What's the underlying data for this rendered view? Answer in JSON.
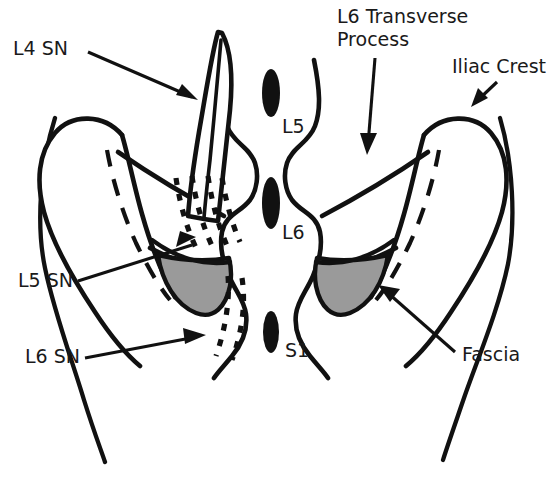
{
  "figure": {
    "background_color": "#ffffff",
    "line_color": "#111111",
    "fascia_fill_color": "#9a9a9a",
    "bone_fill_color": "#ffffff",
    "width": 555,
    "height": 479
  },
  "callouts": [
    {
      "id": "l4-sn",
      "label": "L4 SN",
      "label_x": 13,
      "label_y": 55,
      "anchor": "start",
      "pointer_type": "arrow",
      "meaning": "L4 spinal nerve"
    },
    {
      "id": "l6-transverse-process",
      "label_line_1": "L6 Transverse",
      "label_line_2": "Process",
      "label_x": 337,
      "label_y": 23,
      "anchor": "start",
      "pointer_type": "arrow",
      "meaning": "L6 transverse process"
    },
    {
      "id": "iliac-crest",
      "label": "Iliac Crest",
      "label_x": 452,
      "label_y": 73,
      "anchor": "start",
      "pointer_type": "arrow",
      "meaning": "Iliac crest"
    },
    {
      "id": "l5-sn",
      "label": "L5 SN",
      "label_x": 18,
      "label_y": 287,
      "anchor": "start",
      "pointer_type": "line",
      "meaning": "L5 spinal nerve"
    },
    {
      "id": "l6-sn",
      "label": "L6 SN",
      "label_x": 25,
      "label_y": 363,
      "anchor": "start",
      "pointer_type": "arrow",
      "meaning": "L6 spinal nerve"
    },
    {
      "id": "fascia",
      "label": "Fascia",
      "label_x": 462,
      "label_y": 361,
      "anchor": "start",
      "pointer_type": "arrow",
      "meaning": "Thoracolumbar fascia"
    }
  ],
  "vertebra_labels": [
    {
      "id": "l5",
      "label": "L5",
      "x": 282,
      "y": 133
    },
    {
      "id": "l6",
      "label": "L6",
      "x": 282,
      "y": 239
    },
    {
      "id": "s1",
      "label": "S1",
      "x": 285,
      "y": 357
    }
  ],
  "spinous_processes": [
    {
      "id": "spinous-l5",
      "cx": 271,
      "cy": 93,
      "rx": 9,
      "ry": 24
    },
    {
      "id": "spinous-l6",
      "cx": 271,
      "cy": 203,
      "rx": 9,
      "ry": 26
    },
    {
      "id": "spinous-s1",
      "cx": 271,
      "cy": 332,
      "rx": 8,
      "ry": 21
    }
  ],
  "structures": [
    {
      "id": "left-iliac-crest",
      "name": "Left iliac crest wing"
    },
    {
      "id": "right-iliac-crest",
      "name": "Right iliac crest wing"
    },
    {
      "id": "left-lamina",
      "name": "Left lamina / facet column"
    },
    {
      "id": "right-lamina",
      "name": "Right lamina / facet column"
    },
    {
      "id": "left-fascia",
      "name": "Left fascia shaded region"
    },
    {
      "id": "right-fascia",
      "name": "Right fascia shaded region"
    },
    {
      "id": "transverse-process-blade",
      "name": "L6 transverse process blade"
    },
    {
      "id": "l5-nerve-dotted",
      "name": "L5 spinal nerve dotted path"
    },
    {
      "id": "l6-nerve-dotted",
      "name": "L6 spinal nerve dotted path"
    },
    {
      "id": "left-body-contour",
      "name": "Left body surface contour"
    },
    {
      "id": "right-body-contour",
      "name": "Right body surface contour"
    }
  ]
}
